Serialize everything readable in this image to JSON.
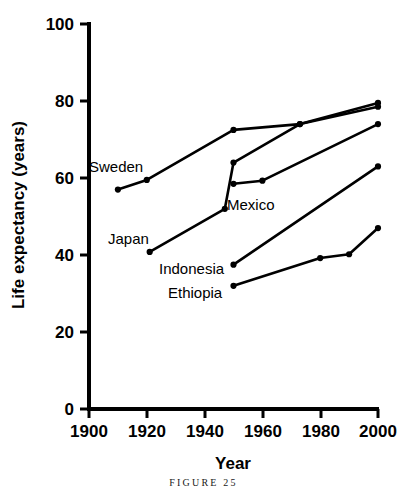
{
  "caption": "FIGURE 25",
  "axes": {
    "x_title": "Year",
    "y_title": "Life expectancy (years)",
    "x_ticks": [
      "1900",
      "1920",
      "1940",
      "1960",
      "1980",
      "2000"
    ],
    "y_ticks": [
      "0",
      "20",
      "40",
      "60",
      "80",
      "100"
    ]
  },
  "series_labels": {
    "sweden": "Sweden",
    "japan": "Japan",
    "mexico": "Mexico",
    "indonesia": "Indonesia",
    "ethiopia": "Ethiopia"
  },
  "colors": {
    "ink": "#000000",
    "background": "#ffffff"
  },
  "chart_data": {
    "type": "line",
    "title": "",
    "xlabel": "Year",
    "ylabel": "Life expectancy (years)",
    "xlim": [
      1900,
      2000
    ],
    "ylim": [
      0,
      100
    ],
    "xticks": [
      1900,
      1920,
      1940,
      1960,
      1980,
      2000
    ],
    "yticks": [
      0,
      20,
      40,
      60,
      80,
      100
    ],
    "grid": false,
    "legend": "inline-labels",
    "markers": true,
    "series": [
      {
        "name": "Sweden",
        "x": [
          1910,
          1920,
          1950,
          1973,
          2000
        ],
        "y": [
          57.0,
          59.5,
          72.5,
          74.0,
          79.5
        ]
      },
      {
        "name": "Japan",
        "x": [
          1921,
          1947,
          1950,
          1973,
          2000
        ],
        "y": [
          40.8,
          52.0,
          64.0,
          74.0,
          78.5
        ]
      },
      {
        "name": "Mexico",
        "x": [
          1950,
          1960,
          2000
        ],
        "y": [
          58.5,
          59.3,
          74.0
        ]
      },
      {
        "name": "Indonesia",
        "x": [
          1950,
          2000
        ],
        "y": [
          37.5,
          63.0
        ]
      },
      {
        "name": "Ethiopia",
        "x": [
          1950,
          1980,
          1990,
          2000
        ],
        "y": [
          32.0,
          39.2,
          40.2,
          47.0
        ]
      }
    ]
  }
}
